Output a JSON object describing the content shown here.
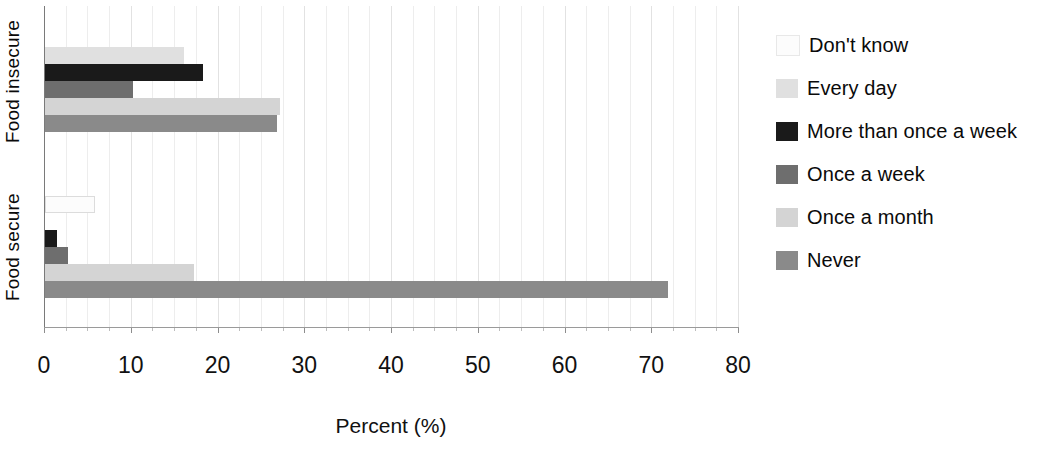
{
  "chart_data": {
    "type": "bar",
    "orientation": "horizontal",
    "title": "",
    "xlabel": "Percent (%)",
    "ylabel": "",
    "xlim": [
      0,
      80
    ],
    "xticks": [
      0,
      10,
      20,
      30,
      40,
      50,
      60,
      70,
      80
    ],
    "xtick_labels": [
      "0",
      "10",
      "20",
      "30",
      "40",
      "50",
      "60",
      "70",
      "80"
    ],
    "minor_tick_step": 2.5,
    "grid": true,
    "grid_axis": "x",
    "categories": [
      "Food insecure",
      "Food secure"
    ],
    "legend_position": "right",
    "series": [
      {
        "name": "Don't know",
        "color": "#fcfcfc",
        "values": [
          0.0,
          5.5
        ]
      },
      {
        "name": "Every day",
        "color": "#e0e0e0",
        "values": [
          16.0,
          0.0
        ]
      },
      {
        "name": "More than once a week",
        "color": "#1a1a1a",
        "values": [
          18.2,
          1.4
        ]
      },
      {
        "name": "Once a week",
        "color": "#6e6e6e",
        "values": [
          10.1,
          2.6
        ]
      },
      {
        "name": "Once a month",
        "color": "#d4d4d4",
        "values": [
          27.1,
          17.2
        ]
      },
      {
        "name": "Never",
        "color": "#8a8a8a",
        "values": [
          26.7,
          71.8
        ]
      }
    ]
  },
  "axes": {
    "y_group_labels": [
      {
        "id": "insecure",
        "label": "Food insecure"
      },
      {
        "id": "secure",
        "label": "Food secure"
      }
    ],
    "x_title": "Percent (%)"
  },
  "legend": {
    "items": [
      {
        "label": "Don't know",
        "color": "#fcfcfc"
      },
      {
        "label": "Every day",
        "color": "#e0e0e0"
      },
      {
        "label": "More than once a week",
        "color": "#1a1a1a"
      },
      {
        "label": "Once a week",
        "color": "#6e6e6e"
      },
      {
        "label": "Once a month",
        "color": "#d4d4d4"
      },
      {
        "label": "Never",
        "color": "#8a8a8a"
      }
    ]
  }
}
